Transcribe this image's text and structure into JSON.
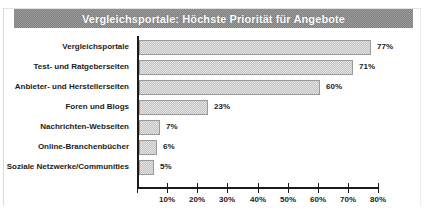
{
  "title": "Vergleichsportale: Höchste Priorität für Angebote",
  "colors": {
    "title_band": "#808080",
    "title_text": "#ffffff",
    "bar_fill": "#c3c3c3",
    "bar_border": "#9a9a9a",
    "axis": "#1a1a1a",
    "label_text": "#1b1b1b",
    "background": "#ffffff"
  },
  "chart_data": {
    "type": "bar",
    "orientation": "horizontal",
    "title": "Vergleichsportale: Höchste Priorität für Angebote",
    "xlabel": "",
    "ylabel": "",
    "xlim": [
      0,
      80
    ],
    "grid": false,
    "legend": false,
    "value_suffix": "%",
    "categories": [
      "Vergleichsportale",
      "Test- und Ratgeberseiten",
      "Anbieter- und Herstellerseiten",
      "Foren und Blogs",
      "Nachrichten-Webseiten",
      "Online-Branchenbücher",
      "Soziale Netzwerke/Communities"
    ],
    "values": [
      77,
      71,
      60,
      23,
      7,
      6,
      5
    ],
    "value_labels": [
      "77%",
      "71%",
      "60%",
      "23%",
      "7%",
      "6%",
      "5%"
    ],
    "xticks": [
      0,
      10,
      20,
      30,
      40,
      50,
      60,
      70,
      80
    ],
    "xtick_labels": [
      "",
      "10%",
      "20%",
      "30%",
      "40%",
      "50%",
      "60%",
      "70%",
      "80%"
    ]
  }
}
